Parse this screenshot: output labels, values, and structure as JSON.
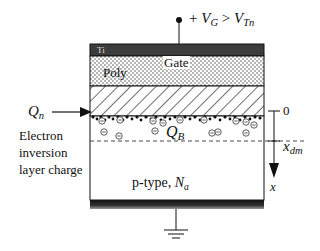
{
  "gate": {
    "terminal_label_prefix": "+ ",
    "vg": "V",
    "vg_sub": "G",
    "relation": " > ",
    "vt": "V",
    "vt_sub": "Tn",
    "metal_label": "Ti",
    "gate_label": "Gate",
    "poly_label": "Poly"
  },
  "inversion": {
    "charge_symbol": "Q",
    "charge_sub": "n",
    "description_lines": [
      "Electron",
      "inversion",
      "layer charge"
    ]
  },
  "depletion": {
    "charge_symbol": "Q",
    "charge_sub": "B"
  },
  "axis": {
    "origin_label": "0",
    "depth_symbol": "x",
    "depth_sub": "dm",
    "direction_label": "x"
  },
  "substrate": {
    "type_label": "p-type, ",
    "doping_symbol": "N",
    "doping_sub": "a"
  },
  "colors": {
    "metal": "#3a3a3a",
    "line": "#111111",
    "back_contact": "#2a2a2a"
  }
}
